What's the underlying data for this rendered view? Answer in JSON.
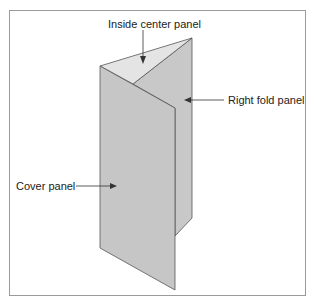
{
  "diagram": {
    "labels": {
      "inside_center": "Inside center panel",
      "right_fold": "Right fold panel",
      "cover": "Cover panel"
    },
    "colors": {
      "panel_fill": "#c8c8c8",
      "inside_fill": "#e2e2e2",
      "stroke": "#555555",
      "frame": "#9a9a9a"
    }
  }
}
